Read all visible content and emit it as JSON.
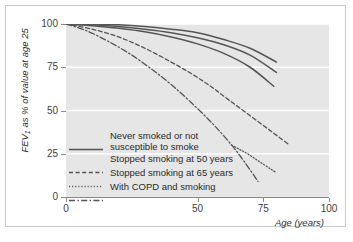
{
  "chart_data": {
    "type": "line",
    "title": "",
    "xlabel": "Age (years)",
    "ylabel": "FEV₁ as % of value at age 25",
    "ylabel_main": "as % of value at age 25",
    "ylabel_symbol": "FEV",
    "ylabel_sub": "1",
    "xlim": [
      0,
      100
    ],
    "ylim": [
      0,
      100
    ],
    "xticks": [
      0,
      50,
      75,
      100
    ],
    "xticklabels": [
      "0",
      "50",
      "75",
      "100"
    ],
    "yticks": [
      0,
      25,
      50,
      75,
      100
    ],
    "yticklabels": [
      "0",
      "25",
      "50",
      "75",
      "100"
    ],
    "grid": "horizontal-white",
    "plot_background": "#e6e6e6",
    "line_color": "#555555",
    "legend_position": "lower-left-inside",
    "series": [
      {
        "name": "Never smoked or not susceptible to smoke",
        "style": "solid",
        "variant": "upper",
        "x": [
          0,
          10,
          20,
          30,
          40,
          50,
          60,
          70,
          80
        ],
        "y": [
          100,
          100,
          99.5,
          98.5,
          97,
          95,
          91,
          86,
          78
        ]
      },
      {
        "name": "Never smoked or not susceptible to smoke",
        "style": "solid",
        "variant": "middle",
        "x": [
          0,
          10,
          20,
          30,
          40,
          50,
          60,
          70,
          80
        ],
        "y": [
          100,
          99.5,
          98.5,
          97,
          95,
          92,
          88,
          82,
          72
        ]
      },
      {
        "name": "Never smoked or not susceptible to smoke",
        "style": "solid",
        "variant": "lower",
        "x": [
          0,
          10,
          20,
          30,
          40,
          50,
          60,
          70,
          79
        ],
        "y": [
          100,
          99,
          97.5,
          95.5,
          92.5,
          88.5,
          83,
          75,
          64
        ]
      },
      {
        "name": "Stopped smoking at 50 years",
        "style": "dashed",
        "x": [
          0,
          10,
          20,
          30,
          40,
          48,
          55,
          62,
          70,
          78,
          85
        ],
        "y": [
          100,
          97,
          92.5,
          86,
          78,
          71,
          64,
          56,
          47,
          38,
          30
        ]
      },
      {
        "name": "Stopped smoking at 65 years",
        "style": "dotted",
        "x": [
          63,
          66,
          69,
          72,
          75,
          78,
          80
        ],
        "y": [
          30,
          27.5,
          25,
          22,
          19,
          16,
          14
        ]
      },
      {
        "name": "With COPD and smoking",
        "style": "dash-dot",
        "x": [
          0,
          8,
          16,
          24,
          32,
          40,
          48,
          56,
          63,
          68,
          73
        ],
        "y": [
          100,
          96,
          90,
          83,
          74.5,
          65,
          54,
          42,
          30,
          20,
          9
        ]
      }
    ]
  },
  "legend": {
    "items": [
      {
        "label": "Never smoked or not\nsusceptible to smoke",
        "style": "solid"
      },
      {
        "label": "Stopped smoking at 50 years",
        "style": "dashed"
      },
      {
        "label": "Stopped smoking at 65 years",
        "style": "dotted"
      },
      {
        "label": "With COPD and smoking",
        "style": "dash-dot"
      }
    ]
  }
}
